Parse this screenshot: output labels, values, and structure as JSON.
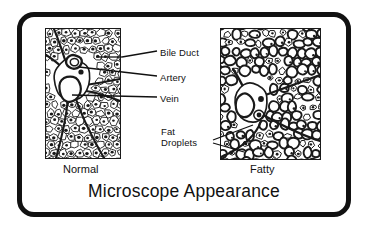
{
  "figure": {
    "title": "Microscope Appearance",
    "frame_color": "#111111",
    "background_color": "#ffffff",
    "ink_color": "#1a1a1a"
  },
  "panels": [
    {
      "id": "normal",
      "caption": "Normal",
      "description": "Normal liver tissue: uniform polygonal hepatocytes with central nuclei, arranged in cords around a portal triad."
    },
    {
      "id": "fatty",
      "caption": "Fatty",
      "description": "Fatty liver tissue: swollen hepatocytes distended by large clear fat droplets, distorted cords."
    }
  ],
  "labels": [
    {
      "id": "bile-duct",
      "text": "Bile Duct"
    },
    {
      "id": "artery",
      "text": "Artery"
    },
    {
      "id": "vein",
      "text": "Vein"
    },
    {
      "id": "fat-droplets",
      "text": "Fat\nDroplets",
      "line1": "Fat",
      "line2": "Droplets"
    }
  ]
}
